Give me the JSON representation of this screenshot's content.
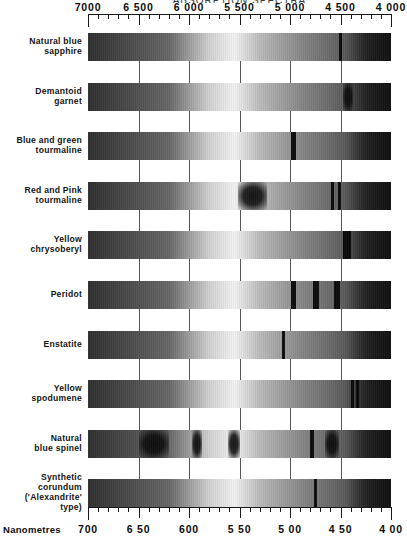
{
  "figure": {
    "top_caption": "ABSORPTION SPECTRA",
    "top_axis": {
      "unit": "Angstroms",
      "ticks": [
        7000,
        6500,
        6000,
        5500,
        5000,
        4500,
        4000
      ],
      "labels": [
        "7000",
        "6 500",
        "6 000",
        "5 500",
        "5 000",
        "4 500",
        "4 000"
      ]
    },
    "bottom_axis": {
      "unit_label": "Nanometres",
      "ticks": [
        700,
        650,
        600,
        550,
        500,
        450,
        400
      ],
      "labels": [
        "700",
        "6 50",
        "600",
        "5 50",
        "5 00",
        "4 50",
        "4 00"
      ]
    }
  },
  "chart_data": {
    "type": "heatmap",
    "title": "ABSORPTION SPECTRA",
    "xlabel": "Nanometres",
    "ylabel": "",
    "xlim": [
      700,
      400
    ],
    "grid": true,
    "legend": "none",
    "x_top_unit": "Angstroms",
    "x_bottom_unit": "Nanometres",
    "categories": [
      "Natural blue sapphire",
      "Demantoid garnet",
      "Blue and green tourmaline",
      "Red and Pink tourmaline",
      "Yellow chrysoberyl",
      "Peridot",
      "Enstatite",
      "Yellow spodumene",
      "Natural blue spinel",
      "Synthetic corundum ('Alexandrite' type)"
    ],
    "series": [
      {
        "name": "Natural blue sapphire",
        "label_lines": [
          "Natural blue",
          "sapphire"
        ],
        "absorption_nm": [
          450
        ],
        "absorption_widths_nm": [
          3
        ]
      },
      {
        "name": "Demantoid garnet",
        "label_lines": [
          "Demantoid",
          "garnet"
        ],
        "absorption_nm": [
          443
        ],
        "absorption_widths_nm": [
          10
        ]
      },
      {
        "name": "Blue and green tourmaline",
        "label_lines": [
          "Blue and green",
          "tourmaline"
        ],
        "absorption_nm": [
          497
        ],
        "absorption_widths_nm": [
          5
        ]
      },
      {
        "name": "Red and Pink tourmaline",
        "label_lines": [
          "Red and Pink",
          "tourmaline"
        ],
        "absorption_nm": [
          537,
          458,
          451
        ],
        "absorption_widths_nm": [
          28,
          3,
          3
        ]
      },
      {
        "name": "Yellow chrysoberyl",
        "label_lines": [
          "Yellow",
          "chrysoberyl"
        ],
        "absorption_nm": [
          444
        ],
        "absorption_widths_nm": [
          8
        ]
      },
      {
        "name": "Peridot",
        "label_lines": [
          "Peridot"
        ],
        "absorption_nm": [
          497,
          474,
          453
        ],
        "absorption_widths_nm": [
          5,
          6,
          6
        ]
      },
      {
        "name": "Enstatite",
        "label_lines": [
          "Enstatite"
        ],
        "absorption_nm": [
          506
        ],
        "absorption_widths_nm": [
          3
        ]
      },
      {
        "name": "Yellow spodumene",
        "label_lines": [
          "Yellow",
          "spodumene"
        ],
        "absorption_nm": [
          438,
          433
        ],
        "absorption_widths_nm": [
          3,
          3
        ]
      },
      {
        "name": "Natural blue spinel",
        "label_lines": [
          "Natural",
          "blue spinel"
        ],
        "absorption_nm": [
          635,
          592,
          555,
          478,
          458
        ],
        "absorption_widths_nm": [
          30,
          10,
          12,
          4,
          14
        ]
      },
      {
        "name": "Synthetic corundum ('Alexandrite' type)",
        "label_lines": [
          "Synthetic",
          "corundum",
          "('Alexandrite'",
          "type)"
        ],
        "absorption_nm": [
          475
        ],
        "absorption_widths_nm": [
          3
        ]
      }
    ]
  }
}
